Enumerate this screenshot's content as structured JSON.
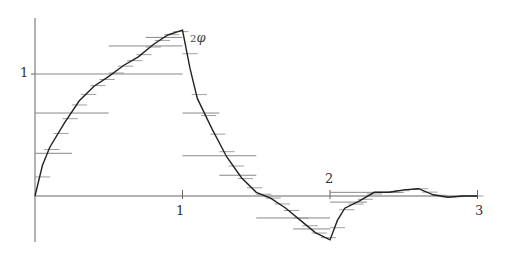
{
  "chart_data": {
    "type": "line",
    "title": "",
    "series_label": "2φ",
    "series_label_prefix": "2",
    "series_label_symbol": "φ",
    "xlabel": "",
    "ylabel": "",
    "xlim": [
      0,
      3
    ],
    "ylim": [
      -0.4,
      1.45
    ],
    "x_ticks": [
      {
        "value": 1,
        "label": "1"
      },
      {
        "value": 2,
        "label": "2"
      },
      {
        "value": 3,
        "label": "3"
      }
    ],
    "y_ticks": [
      {
        "value": 1,
        "label": "1"
      }
    ],
    "series": [
      {
        "name": "2φ",
        "x": [
          0,
          0.05,
          0.1,
          0.2,
          0.3,
          0.4,
          0.5,
          0.6,
          0.7,
          0.8,
          0.9,
          1.0,
          1.05,
          1.1,
          1.2,
          1.3,
          1.4,
          1.5,
          1.6,
          1.7,
          1.8,
          1.9,
          2.0,
          2.05,
          2.1,
          2.2,
          2.3,
          2.4,
          2.5,
          2.6,
          2.7,
          2.8,
          2.9,
          3.0
        ],
        "values": [
          0,
          0.25,
          0.4,
          0.6,
          0.78,
          0.9,
          0.98,
          1.07,
          1.14,
          1.24,
          1.32,
          1.36,
          1.05,
          0.8,
          0.55,
          0.32,
          0.15,
          0.03,
          -0.02,
          -0.1,
          -0.2,
          -0.3,
          -0.36,
          -0.2,
          -0.1,
          -0.04,
          0.03,
          0.03,
          0.05,
          0.06,
          0.01,
          -0.01,
          0,
          0
        ]
      }
    ],
    "step_bars": [
      {
        "x0": 0.0,
        "x1": 1.0,
        "y": 1.0
      },
      {
        "x0": 0.0,
        "x1": 0.5,
        "y": 0.68
      },
      {
        "x0": 0.0,
        "x1": 0.25,
        "y": 0.35
      },
      {
        "x0": 0.5,
        "x1": 1.0,
        "y": 1.23
      },
      {
        "x0": 0.75,
        "x1": 1.0,
        "y": 1.3
      },
      {
        "x0": 1.0,
        "x1": 1.5,
        "y": 0.33
      },
      {
        "x0": 1.0,
        "x1": 1.25,
        "y": 0.68
      },
      {
        "x0": 1.25,
        "x1": 1.5,
        "y": 0.17
      },
      {
        "x0": 1.5,
        "x1": 2.0,
        "y": -0.18
      },
      {
        "x0": 1.75,
        "x1": 2.0,
        "y": -0.27
      },
      {
        "x0": 2.0,
        "x1": 2.5,
        "y": 0.03
      },
      {
        "x0": 2.0,
        "x1": 2.25,
        "y": -0.05
      }
    ],
    "grid": false,
    "legend": "none",
    "colors": {
      "curve": "#222222",
      "axis": "#666666",
      "bars": "#888888"
    }
  },
  "labels": {
    "x1": "1",
    "x2": "2",
    "x3": "3",
    "y1": "1",
    "fn_prefix": "2",
    "fn_symbol": "φ"
  }
}
